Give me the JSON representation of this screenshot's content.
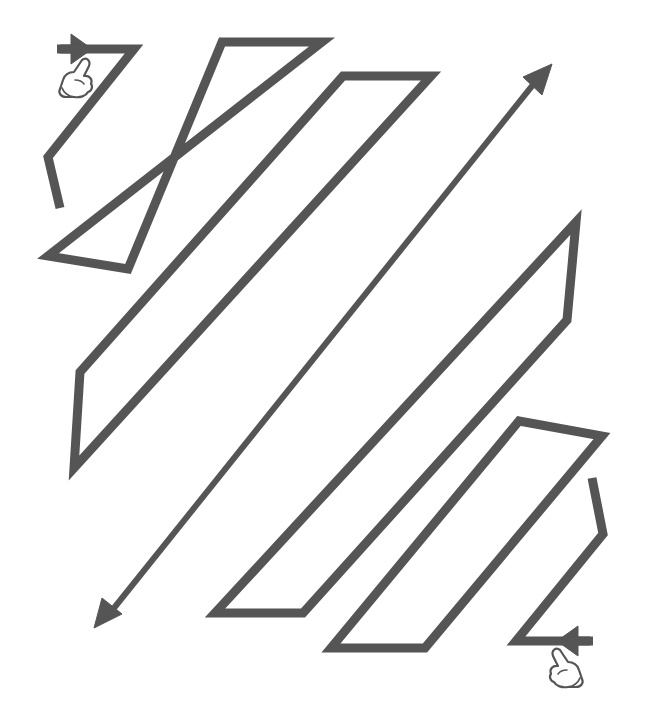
{
  "worksheet": {
    "title": "Line tracing zigzag worksheet",
    "colors": {
      "background": "#ffffff",
      "stroke": "#555555",
      "hand_outline": "#555555",
      "hand_fill": "#ffffff"
    },
    "stroke_width": 9,
    "shapes": [
      {
        "id": "zigzag-start",
        "kind": "polyline",
        "points": "60,49 134,49 48,157 60,208"
      },
      {
        "id": "parallelogram-1",
        "kind": "polygon",
        "points": "222,42 322,42 48,256 128,269"
      },
      {
        "id": "parallelogram-2",
        "kind": "polygon",
        "points": "343,76 431,76 74,468 80,372"
      },
      {
        "id": "parallelogram-3",
        "kind": "polygon",
        "points": "576,222 567,320 303,613 215,613"
      },
      {
        "id": "parallelogram-4",
        "kind": "polygon",
        "points": "519,421 602,436 425,648 331,648"
      },
      {
        "id": "zigzag-end",
        "kind": "polyline",
        "points": "590,641 516,641 603,534 592,478"
      }
    ],
    "double_arrow": {
      "id": "diagonal-double-arrow",
      "x1": 540,
      "y1": 76,
      "x2": 106,
      "y2": 618
    },
    "arrows": [
      {
        "id": "start-arrow",
        "direction": "right",
        "points": "71,34 92,49 71,64"
      },
      {
        "id": "end-arrow",
        "direction": "left",
        "points": "578,626 557,641 578,656"
      },
      {
        "id": "diagonal-arrow-head-top-right",
        "direction": "up-right",
        "points": "552,64 523,77 542,95"
      },
      {
        "id": "diagonal-arrow-head-bottom-left",
        "direction": "down-left",
        "points": "94,628 102,598 122,614"
      }
    ],
    "hands": [
      {
        "id": "start-hand",
        "label": "start pointer",
        "transform": "translate(58,58)"
      },
      {
        "id": "end-hand",
        "label": "end pointer",
        "transform": "translate(548,648) scale(-1,1) translate(-36,0)"
      }
    ]
  }
}
